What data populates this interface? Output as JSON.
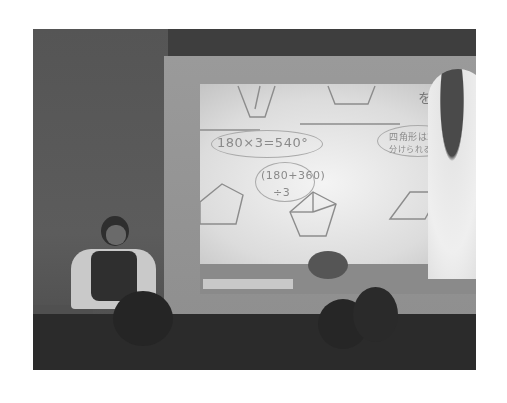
{
  "photo": {
    "description": "Grayscale photo of a classroom: a teacher seated at left in front of a projection screen showing handwritten geometry (polygons) and angle-sum calculations; a person standing at right pointing at the screen; audience heads silhouetted in the foreground.",
    "tone": "grayscale",
    "frame_color": "#ffffff",
    "background_color": "#5a5a5a"
  },
  "screen_text": {
    "equation_1": "180×3=540°",
    "equation_2": "(180+360)",
    "equation_3": "÷3",
    "note_line_1": "四角形は2つ",
    "note_line_2": "分けられる",
    "japanese_heading": "を求め"
  },
  "shapes_on_screen": [
    "trapezoid",
    "trapezoid",
    "pentagon",
    "pentagon-divided",
    "parallelogram"
  ]
}
